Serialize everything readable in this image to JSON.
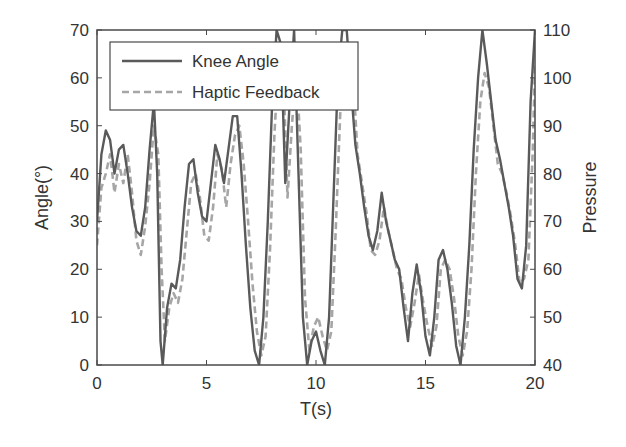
{
  "chart_data": {
    "type": "line",
    "title": "",
    "xlabel": "T(s)",
    "ylabel": "Angle(°)",
    "ylabel_right": "Pressure",
    "xlim": [
      0,
      20
    ],
    "ylim": [
      0,
      70
    ],
    "ylim_right": [
      40,
      110
    ],
    "xticks": [
      0,
      5,
      10,
      15,
      20
    ],
    "yticks": [
      0,
      10,
      20,
      30,
      40,
      50,
      60,
      70
    ],
    "yticks_right": [
      40,
      50,
      60,
      70,
      80,
      90,
      100,
      110
    ],
    "grid": false,
    "legend_position": "top-left",
    "colors": {
      "knee_angle": "#5a5a5a",
      "haptic_feedback": "#a6a6a6",
      "axis": "#4a4a4a",
      "text": "#333333"
    },
    "series": [
      {
        "name": "Knee Angle",
        "style": "solid",
        "x": [
          0,
          0.2,
          0.4,
          0.6,
          0.8,
          1.0,
          1.2,
          1.4,
          1.6,
          1.8,
          2.0,
          2.2,
          2.4,
          2.6,
          2.75,
          2.9,
          3.0,
          3.2,
          3.4,
          3.6,
          3.8,
          4.0,
          4.2,
          4.4,
          4.6,
          4.8,
          5.0,
          5.2,
          5.4,
          5.6,
          5.8,
          6.0,
          6.2,
          6.4,
          6.6,
          6.8,
          7.0,
          7.2,
          7.4,
          7.6,
          7.8,
          8.0,
          8.2,
          8.4,
          8.6,
          8.8,
          9.0,
          9.2,
          9.4,
          9.6,
          9.8,
          10.0,
          10.2,
          10.4,
          10.6,
          10.8,
          11.0,
          11.2,
          11.4,
          11.6,
          11.8,
          12.0,
          12.2,
          12.4,
          12.6,
          12.8,
          13.0,
          13.2,
          13.4,
          13.6,
          13.8,
          14.0,
          14.2,
          14.4,
          14.6,
          14.8,
          15.0,
          15.2,
          15.4,
          15.6,
          15.8,
          16.0,
          16.2,
          16.4,
          16.6,
          16.8,
          17.0,
          17.2,
          17.4,
          17.6,
          17.8,
          18.0,
          18.2,
          18.4,
          18.6,
          18.8,
          19.0,
          19.2,
          19.4,
          19.6,
          19.8,
          20.0
        ],
        "y": [
          30,
          44,
          49,
          47,
          40,
          45,
          46,
          40,
          33,
          28,
          27,
          33,
          45,
          55,
          40,
          5,
          0,
          12,
          17,
          16,
          22,
          33,
          42,
          43,
          36,
          31,
          30,
          38,
          46,
          43,
          38,
          45,
          52,
          52,
          40,
          25,
          12,
          3,
          0,
          10,
          30,
          55,
          70,
          67,
          38,
          55,
          70,
          40,
          10,
          0,
          5,
          7,
          3,
          0,
          10,
          35,
          60,
          70,
          70,
          58,
          46,
          40,
          33,
          27,
          24,
          28,
          36,
          30,
          26,
          22,
          20,
          12,
          5,
          15,
          21,
          15,
          6,
          2,
          10,
          22,
          24,
          20,
          13,
          4,
          0,
          10,
          25,
          45,
          60,
          70,
          63,
          55,
          47,
          43,
          38,
          33,
          27,
          18,
          16,
          25,
          55,
          70
        ]
      },
      {
        "name": "Haptic Feedback",
        "style": "dashed",
        "x": [
          0,
          0.2,
          0.4,
          0.6,
          0.8,
          1.0,
          1.2,
          1.4,
          1.6,
          1.8,
          2.0,
          2.2,
          2.4,
          2.6,
          2.8,
          2.95,
          3.1,
          3.3,
          3.5,
          3.7,
          3.9,
          4.1,
          4.3,
          4.5,
          4.7,
          4.9,
          5.1,
          5.3,
          5.5,
          5.7,
          5.9,
          6.1,
          6.3,
          6.5,
          6.7,
          6.9,
          7.1,
          7.3,
          7.5,
          7.7,
          7.9,
          8.1,
          8.3,
          8.5,
          8.7,
          8.9,
          9.1,
          9.3,
          9.5,
          9.7,
          9.9,
          10.1,
          10.3,
          10.5,
          10.7,
          10.9,
          11.1,
          11.3,
          11.5,
          11.7,
          11.9,
          12.1,
          12.3,
          12.5,
          12.7,
          12.9,
          13.1,
          13.3,
          13.5,
          13.7,
          13.9,
          14.1,
          14.3,
          14.5,
          14.7,
          14.9,
          15.1,
          15.3,
          15.5,
          15.7,
          15.9,
          16.1,
          16.3,
          16.5,
          16.7,
          16.9,
          17.1,
          17.3,
          17.5,
          17.7,
          17.9,
          18.1,
          18.3,
          18.5,
          18.7,
          18.9,
          19.1,
          19.3,
          19.5,
          19.7,
          19.9,
          20.0
        ],
        "y": [
          25,
          37,
          40,
          44,
          36,
          42,
          38,
          44,
          36,
          26,
          23,
          29,
          38,
          50,
          44,
          20,
          5,
          12,
          15,
          13,
          18,
          28,
          38,
          40,
          35,
          27,
          26,
          33,
          44,
          41,
          33,
          42,
          48,
          50,
          42,
          30,
          17,
          7,
          2,
          6,
          24,
          48,
          65,
          62,
          35,
          50,
          62,
          45,
          14,
          3,
          8,
          10,
          6,
          3,
          7,
          28,
          52,
          65,
          66,
          60,
          44,
          38,
          32,
          24,
          23,
          26,
          33,
          28,
          24,
          20,
          18,
          12,
          8,
          13,
          19,
          13,
          8,
          4,
          8,
          20,
          22,
          20,
          14,
          6,
          2,
          7,
          20,
          40,
          55,
          61,
          58,
          50,
          42,
          40,
          36,
          31,
          25,
          17,
          18,
          22,
          45,
          63
        ]
      }
    ]
  }
}
